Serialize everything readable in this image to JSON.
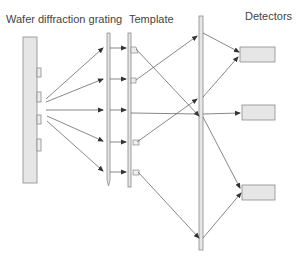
{
  "labels": {
    "wafer": "Wafer diffraction grating",
    "template": "Template",
    "detectors": "Detectors"
  },
  "colors": {
    "fill": "#e6e6e6",
    "stroke": "#808080",
    "line": "#555555",
    "text": "#444444"
  },
  "components": [
    {
      "name": "wafer",
      "x": 23,
      "y": 37,
      "w": 14,
      "h": 146
    },
    {
      "name": "diffraction-grating",
      "x": 107,
      "y": 33,
      "w": 3,
      "h": 152
    },
    {
      "name": "template",
      "x": 128,
      "y": 33,
      "w": 3,
      "h": 154
    },
    {
      "name": "mirror",
      "x": 199,
      "y": 16,
      "w": 4,
      "h": 234
    },
    {
      "name": "detector-1",
      "x": 240,
      "y": 47,
      "w": 35,
      "h": 15
    },
    {
      "name": "detector-2",
      "x": 242,
      "y": 105,
      "w": 33,
      "h": 15
    },
    {
      "name": "detector-3",
      "x": 242,
      "y": 185,
      "w": 33,
      "h": 15
    }
  ]
}
